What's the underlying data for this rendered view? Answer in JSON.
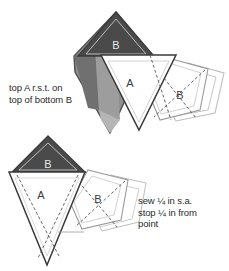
{
  "page": {
    "width": 229,
    "height": 271,
    "background": "#ffffff"
  },
  "colors": {
    "fabric_dark": "#4a4a4a",
    "fabric_mid": "#8f8f8f",
    "fabric_mid_dark": "#6e6e6e",
    "fabric_light": "#b5b5b5",
    "fabric_white": "#ffffff",
    "outline_dark": "#3a3a3a",
    "outline_light": "#bdbdbd",
    "outline_mid": "#9a9a9a",
    "text": "#2b2b2b",
    "dashed_line": "#555555"
  },
  "captions": {
    "top": {
      "line1": "top A r.s.t. on",
      "line2": "top of bottom B"
    },
    "bottom": {
      "line1": "sew ¼ in s.a.",
      "line2": "stop ¼ in from",
      "line3": "point"
    },
    "clipped_header": "·"
  },
  "figures": {
    "upper": {
      "name": "upper-assembly",
      "pieces": [
        {
          "label": "B",
          "role": "dark-triangle-top",
          "fill": "#4a4a4a"
        },
        {
          "label": "",
          "role": "gray-kite-underlay",
          "fill": "#8f8f8f"
        },
        {
          "label": "A",
          "role": "white-triangle",
          "fill": "#ffffff"
        },
        {
          "label": "B",
          "role": "white-quad-right",
          "fill": "#ffffff"
        }
      ]
    },
    "lower": {
      "name": "lower-assembly",
      "pieces": [
        {
          "label": "B",
          "role": "dark-triangle-top",
          "fill": "#4a4a4a"
        },
        {
          "label": "A",
          "role": "white-triangle-inverted",
          "fill": "#ffffff"
        },
        {
          "label": "B",
          "role": "white-quad-right",
          "fill": "#ffffff"
        }
      ]
    }
  },
  "labels": {
    "upper_B_top": "B",
    "upper_A": "A",
    "upper_B_right": "B",
    "lower_B_top": "B",
    "lower_A": "A",
    "lower_B_right": "B"
  }
}
